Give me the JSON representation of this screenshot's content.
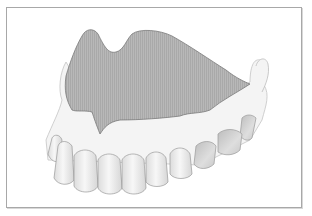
{
  "figure": {
    "colors": {
      "frame_border": "#a8a8a8",
      "palate_fill": "#b4b4b4",
      "palate_stroke": "#7a7a7a",
      "gum_fill": "#f4f4f4",
      "gum_stroke": "#bdbdbd",
      "tooth_fill": "#efefef",
      "tooth_stroke": "#9a9a9a",
      "molar_fill": "#cfcfcf"
    },
    "caption": ""
  }
}
